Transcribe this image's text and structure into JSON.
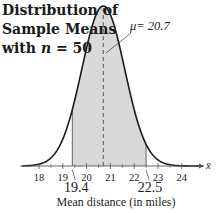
{
  "chart_data": {
    "type": "area",
    "title": [
      "Distribution of",
      "Sample Means",
      "with n = 50"
    ],
    "title_line3_prefix": "with ",
    "title_line3_var": "n",
    "title_line3_suffix": " = 50",
    "xlabel": "Mean distance (in miles)",
    "axis_var": "x̄",
    "distribution": "normal",
    "mean": 20.7,
    "mean_label": "μ= 20.7",
    "shaded_interval": [
      19.4,
      22.5
    ],
    "shaded_labels": [
      "19.4",
      "22.5"
    ],
    "xticks": [
      18,
      19,
      20,
      21,
      22,
      23,
      24
    ],
    "xlim": [
      17.3,
      24.9
    ],
    "std_error_approx": 0.9,
    "colors": {
      "shade": "#d9d9d9",
      "curve": "#1a1a1a",
      "axis": "#555555"
    }
  }
}
